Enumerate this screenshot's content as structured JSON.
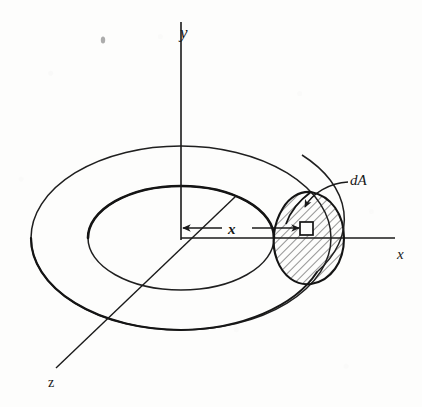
{
  "figure": {
    "kind": "engineering-diagram",
    "background_color": "#fdfdfc",
    "ink_color": "#1a1a1a"
  },
  "labels": {
    "y_axis": "y",
    "x_axis": "x",
    "z_axis": "z",
    "x_dimension": "x",
    "area_element": "dA"
  },
  "geometry": {
    "origin": {
      "x": 181,
      "y": 238
    },
    "outer_ellipse": {
      "cx": 181,
      "cy": 238,
      "rx": 150,
      "ry": 92
    },
    "inner_ellipse": {
      "cx": 181,
      "cy": 238,
      "rx": 93,
      "ry": 52
    },
    "y_axis_line": {
      "x1": 181,
      "y1": 22,
      "x2": 181,
      "y2": 238
    },
    "x_axis_line": {
      "x1": 181,
      "y1": 238,
      "x2": 395,
      "y2": 238
    },
    "z_axis_line": {
      "x1": 236,
      "y1": 196,
      "x2": 56,
      "y2": 368
    },
    "x_dimension_line": {
      "x1": 181,
      "y1": 228,
      "x2": 312,
      "y2": 228
    },
    "cross_section_center": {
      "x": 311,
      "y": 238
    },
    "area_element_square": {
      "x": 300,
      "y": 222,
      "size": 13
    }
  },
  "hatching": {
    "angle_deg": 45,
    "spacing_px": 6,
    "stroke_width": 1,
    "color": "#2b2b2b"
  },
  "annotations": {
    "speck_artifact": {
      "x": 103,
      "y": 40
    }
  }
}
